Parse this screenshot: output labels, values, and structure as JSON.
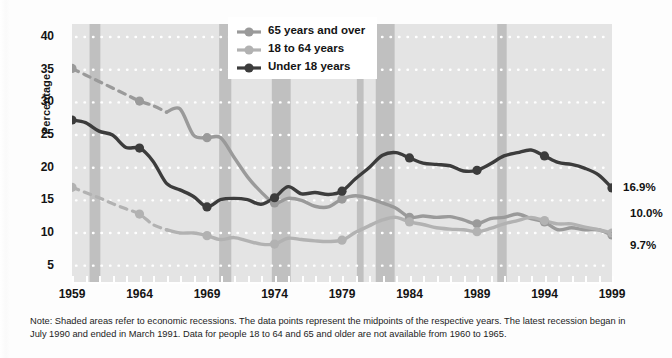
{
  "chart_data": {
    "type": "line",
    "title": "",
    "xlabel": "",
    "ylabel": "Percentage",
    "xlim": [
      1959,
      1999
    ],
    "ylim": [
      2.5,
      42
    ],
    "grid": true,
    "legend_position": "top-center",
    "x": [
      1959,
      1960,
      1961,
      1962,
      1963,
      1964,
      1965,
      1966,
      1967,
      1968,
      1969,
      1970,
      1971,
      1972,
      1973,
      1974,
      1975,
      1976,
      1977,
      1978,
      1979,
      1980,
      1981,
      1982,
      1983,
      1984,
      1985,
      1986,
      1987,
      1988,
      1989,
      1990,
      1991,
      1992,
      1993,
      1994,
      1995,
      1996,
      1997,
      1998,
      1999
    ],
    "series": [
      {
        "name": "65 years and over",
        "color": "#9a9a9a",
        "dashed_from": 1959,
        "dashed_to": 1966,
        "values": [
          35.2,
          34.2,
          33.2,
          32.2,
          31.2,
          30.2,
          29.5,
          28.5,
          29.0,
          25.0,
          24.6,
          24.6,
          21.6,
          18.6,
          16.3,
          14.6,
          15.3,
          15.0,
          14.1,
          14.0,
          15.2,
          15.7,
          15.3,
          14.6,
          13.8,
          12.4,
          12.6,
          12.4,
          12.5,
          12.0,
          11.4,
          12.2,
          12.4,
          12.9,
          12.2,
          11.7,
          10.5,
          10.8,
          10.5,
          10.5,
          9.7
        ]
      },
      {
        "name": "18 to 64 years",
        "color": "#b2b2b2",
        "dashed_from": 1959,
        "dashed_to": 1966,
        "values": [
          17.0,
          16.2,
          15.4,
          14.5,
          13.7,
          12.9,
          11.3,
          10.5,
          10.0,
          10.0,
          9.6,
          9.0,
          9.3,
          8.8,
          8.3,
          8.3,
          9.2,
          9.0,
          8.8,
          8.7,
          8.9,
          10.1,
          11.1,
          12.0,
          12.4,
          11.7,
          11.3,
          10.8,
          10.6,
          10.5,
          10.2,
          10.7,
          11.4,
          11.9,
          12.4,
          11.9,
          11.4,
          11.4,
          10.9,
          10.5,
          10.0
        ]
      },
      {
        "name": "Under 18 years",
        "color": "#3c3c3c",
        "values": [
          27.3,
          26.9,
          25.6,
          25.0,
          23.1,
          23.0,
          21.0,
          17.6,
          16.6,
          15.6,
          14.0,
          15.1,
          15.3,
          15.1,
          14.4,
          15.4,
          17.1,
          16.0,
          16.2,
          15.9,
          16.4,
          18.3,
          20.0,
          21.9,
          22.3,
          21.5,
          20.7,
          20.5,
          20.3,
          19.5,
          19.6,
          20.6,
          21.8,
          22.3,
          22.7,
          21.8,
          20.8,
          20.5,
          19.9,
          18.9,
          16.9
        ]
      }
    ],
    "end_labels": [
      {
        "series": "Under 18 years",
        "value": "16.9%"
      },
      {
        "series": "18 to 64 years",
        "value": "10.0%"
      },
      {
        "series": "65 years and over",
        "value": "9.7%"
      }
    ],
    "recession_bands": [
      {
        "start": 1960.3,
        "end": 1961.1
      },
      {
        "start": 1969.9,
        "end": 1970.8
      },
      {
        "start": 1973.8,
        "end": 1975.2
      },
      {
        "start": 1980.1,
        "end": 1980.6
      },
      {
        "start": 1981.5,
        "end": 1982.9
      },
      {
        "start": 1990.5,
        "end": 1991.2
      }
    ],
    "y_ticks": [
      5,
      10,
      15,
      20,
      25,
      30,
      35,
      40
    ],
    "x_ticks": [
      1959,
      1964,
      1969,
      1974,
      1979,
      1984,
      1989,
      1994,
      1999
    ]
  },
  "legend": {
    "items": [
      {
        "label": "65 years and over",
        "color": "#9a9a9a"
      },
      {
        "label": "18 to 64 years",
        "color": "#b2b2b2"
      },
      {
        "label": "Under 18 years",
        "color": "#3c3c3c"
      }
    ]
  },
  "footnote": {
    "text": "Note: Shaded areas refer to economic recessions. The data points represent the midpoints of the respective years. The latest recession began in July 1990 and ended in March 1991. Data for people 18 to 64 and 65 and older are not available from 1960 to 1965."
  },
  "colors": {
    "plot_background": "#e4e4e4",
    "recession_band": "#c0c0c0",
    "gridline": "#ffffff",
    "page_background": "#fdfdfd"
  }
}
